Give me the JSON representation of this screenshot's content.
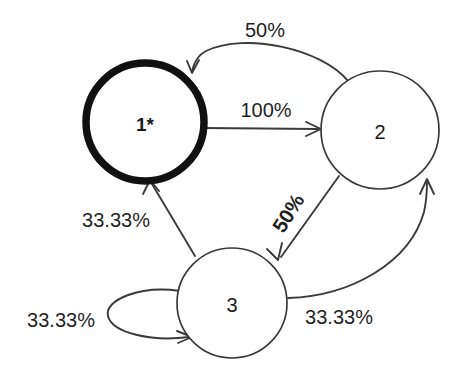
{
  "diagram": {
    "type": "markov-state-transition-diagram",
    "background_color": "#ffffff",
    "stroke_color": "#3a3a3a",
    "accept_stroke_color": "#111111",
    "text_color": "#1a1a1a",
    "nodes": [
      {
        "id": "1",
        "label": "1*",
        "accepting": true,
        "cx": 145,
        "cy": 122,
        "r": 59
      },
      {
        "id": "2",
        "label": "2",
        "accepting": false,
        "cx": 380,
        "cy": 130,
        "r": 59
      },
      {
        "id": "3",
        "label": "3",
        "accepting": false,
        "cx": 232,
        "cy": 303,
        "r": 55
      }
    ],
    "edges": [
      {
        "id": "edge-2-to-1",
        "from": "2",
        "to": "1",
        "label": "50%",
        "label_x": 265,
        "label_y": 30,
        "rotation": 0,
        "shape": "curve-top"
      },
      {
        "id": "edge-1-to-2",
        "from": "1",
        "to": "2",
        "label": "100%",
        "label_x": 266,
        "label_y": 110,
        "rotation": 0,
        "shape": "straight-horizontal"
      },
      {
        "id": "edge-2-to-3",
        "from": "2",
        "to": "3",
        "label": "50%",
        "label_x": 288,
        "label_y": 213,
        "rotation": -58,
        "shape": "straight-diagonal"
      },
      {
        "id": "edge-3-to-1",
        "from": "3",
        "to": "1",
        "label": "33.33%",
        "label_x": 116,
        "label_y": 220,
        "rotation": 0,
        "shape": "straight-diagonal"
      },
      {
        "id": "edge-3-to-3",
        "from": "3",
        "to": "3",
        "label": "33.33%",
        "label_x": 61,
        "label_y": 320,
        "rotation": 0,
        "shape": "self-loop"
      },
      {
        "id": "edge-3-to-2",
        "from": "3",
        "to": "2",
        "label": "33.33%",
        "label_x": 339,
        "label_y": 317,
        "rotation": 0,
        "shape": "curve-right"
      }
    ]
  }
}
